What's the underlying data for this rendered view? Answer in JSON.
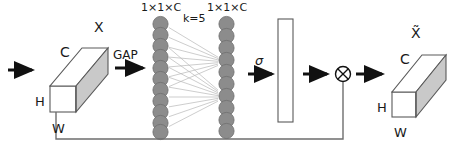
{
  "diagram": {
    "type": "neural-network-block-diagram",
    "colors": {
      "stroke": "#3f3f3f",
      "cube_face": "#c9c9c9",
      "cube_top": "#ffffff",
      "node_fill": "#8c8c8c",
      "node_stroke": "#6b6b6b",
      "edge": "#b5b5b5",
      "arrow": "#111111",
      "text": "#1a1a1a",
      "skip_line": "#6e6e6e"
    },
    "labels": {
      "input_tensor": "X",
      "input_channels": "C",
      "input_height": "H",
      "input_width": "W",
      "gap": "GAP",
      "vector_left": "1×1×C",
      "vector_right": "1×1×C",
      "kernel": "k=5",
      "sigma": "σ",
      "multiply": "⊗",
      "output_tensor": "X̃",
      "output_channels": "C",
      "output_height": "H",
      "output_width": "W"
    },
    "nodes": {
      "left_column_count": 11,
      "right_column_count": 10
    },
    "stages": [
      {
        "name": "input-feature-map",
        "label": "X",
        "dims": [
          "C",
          "H",
          "W"
        ]
      },
      {
        "name": "global-average-pooling",
        "label": "GAP"
      },
      {
        "name": "channel-descriptor",
        "label": "1×1×C"
      },
      {
        "name": "conv1d",
        "label": "k=5"
      },
      {
        "name": "channel-weights",
        "label": "1×1×C"
      },
      {
        "name": "sigmoid",
        "label": "σ"
      },
      {
        "name": "attention-bar",
        "label": ""
      },
      {
        "name": "element-wise-multiply",
        "label": "⊗"
      },
      {
        "name": "output-feature-map",
        "label": "X̃",
        "dims": [
          "C",
          "H",
          "W"
        ]
      }
    ]
  }
}
